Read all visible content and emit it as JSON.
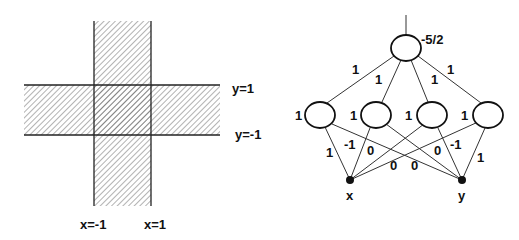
{
  "region_diagram": {
    "vertical_band": {
      "x_from": -1,
      "x_to": 1
    },
    "horizontal_band": {
      "y_from": -1,
      "y_to": 1
    },
    "labels": {
      "y_upper": "y=1",
      "y_lower": "y=-1",
      "x_left": "x=-1",
      "x_right": "x=1"
    },
    "fill_pattern": "diagonal-hatch"
  },
  "network": {
    "output_node": {
      "bias_label": "-5/2"
    },
    "hidden_nodes": [
      {
        "id": "h1",
        "bias_label": "1",
        "output_weight_label": "1"
      },
      {
        "id": "h2",
        "bias_label": "1",
        "output_weight_label": "1"
      },
      {
        "id": "h3",
        "bias_label": "1",
        "output_weight_label": "1"
      },
      {
        "id": "h4",
        "bias_label": "1",
        "output_weight_label": "1"
      }
    ],
    "input_nodes": [
      {
        "id": "x",
        "label": "x"
      },
      {
        "id": "y",
        "label": "y"
      }
    ],
    "input_edges": [
      {
        "from": "x",
        "to": "h1",
        "weight_label": "1"
      },
      {
        "from": "x",
        "to": "h2",
        "weight_label": "-1"
      },
      {
        "from": "x",
        "to": "h3",
        "weight_label": "0"
      },
      {
        "from": "x",
        "to": "h4",
        "weight_label": "0"
      },
      {
        "from": "y",
        "to": "h1",
        "weight_label": "0"
      },
      {
        "from": "y",
        "to": "h2",
        "weight_label": "0"
      },
      {
        "from": "y",
        "to": "h3",
        "weight_label": "-1"
      },
      {
        "from": "y",
        "to": "h4",
        "weight_label": "1"
      }
    ]
  }
}
